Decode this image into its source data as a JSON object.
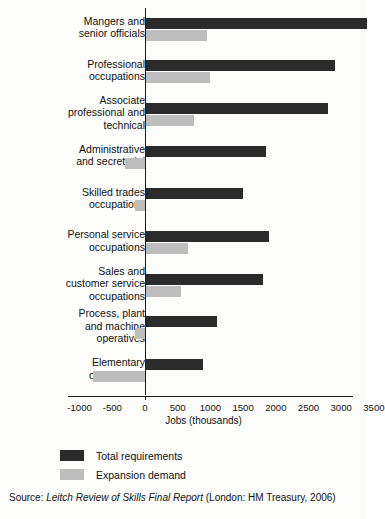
{
  "chart_data": {
    "type": "bar",
    "orientation": "horizontal",
    "title": "",
    "xlabel": "Jobs (thousands)",
    "ylabel": "",
    "xlim": [
      -1250,
      3600
    ],
    "xticks": [
      -1000,
      -500,
      0,
      500,
      1000,
      1500,
      2000,
      2500,
      3000,
      3500
    ],
    "xticklabels": [
      "-1000",
      "-500",
      "0",
      "500",
      "1000",
      "1500",
      "2000",
      "2500",
      "3000",
      "3500"
    ],
    "grid": false,
    "legend_position": "below-axes",
    "categories": [
      "Mangers and\nsenior officials",
      "Professional\noccupations",
      "Associate\nprofessional and\ntechnical",
      "Administrative\nand secretarial",
      "Skilled trades\noccupations",
      "Personal service\noccupations",
      "Sales and\ncustomer service\noccupations",
      "Process, plant\nand machine\noperatives",
      "Elementary\noccupations"
    ],
    "series": [
      {
        "name": "Total requirements",
        "color": "#2b2b2b",
        "values": [
          3400,
          2900,
          2800,
          1850,
          1500,
          1900,
          1800,
          1100,
          880
        ]
      },
      {
        "name": "Expansion demand",
        "color": "#bdbdbd",
        "values": [
          950,
          1000,
          750,
          -300,
          -150,
          650,
          550,
          -160,
          -800
        ]
      }
    ],
    "source": {
      "prefix": "Source: ",
      "italic": "Leitch Review of Skills Final Report",
      "suffix": " (London: HM Treasury, 2006)"
    }
  },
  "legend": {
    "items": [
      {
        "label": "Total requirements",
        "color": "#2b2b2b"
      },
      {
        "label": "Expansion demand",
        "color": "#bdbdbd"
      }
    ]
  }
}
